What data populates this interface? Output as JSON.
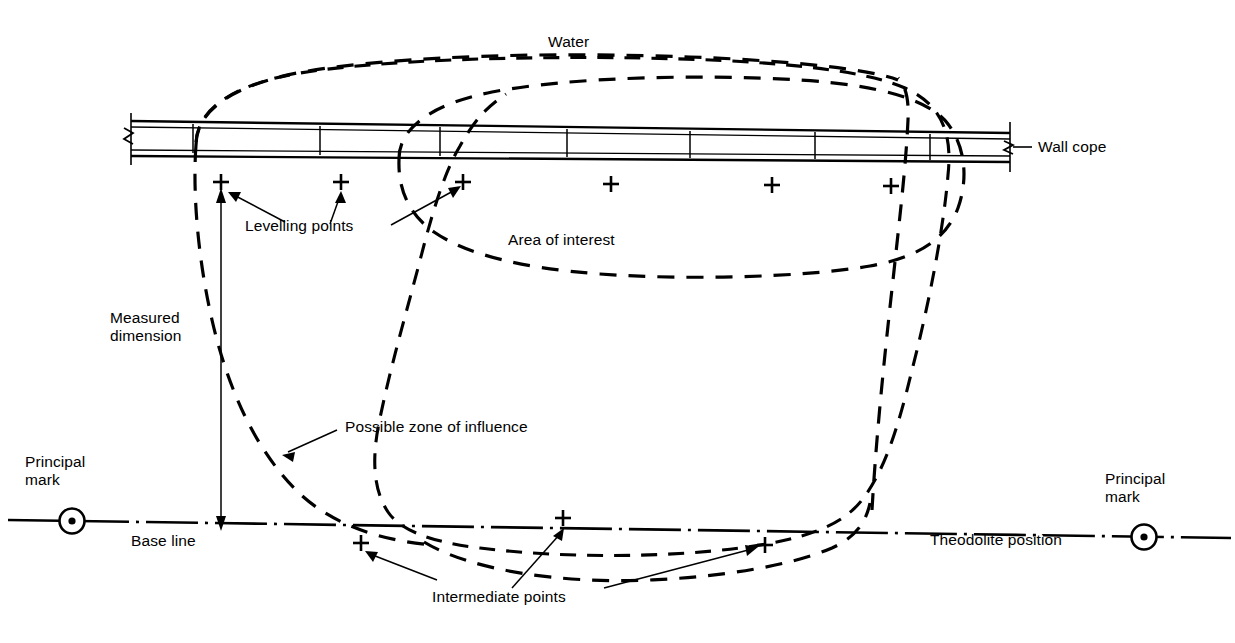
{
  "diagram": {
    "title_labels": {
      "water": "Water",
      "wall_cope": "Wall cope",
      "levelling_points": "Levelling points",
      "area_of_interest": "Area of interest",
      "measured_dimension_line1": "Measured",
      "measured_dimension_line2": "dimension",
      "possible_zone_of_influence": "Possible zone of influence",
      "principal_mark_left_line1": "Principal",
      "principal_mark_left_line2": "mark",
      "principal_mark_right_line1": "Principal",
      "principal_mark_right_line2": "mark",
      "base_line": "Base line",
      "theodolite_position": "Theodolite position",
      "intermediate_points": "Intermediate points"
    },
    "colors": {
      "ink": "#000000",
      "paper": "#ffffff"
    },
    "levelling_points": [
      {
        "x": 221,
        "y": 182
      },
      {
        "x": 341,
        "y": 182
      },
      {
        "x": 463,
        "y": 182
      },
      {
        "x": 611,
        "y": 182
      },
      {
        "x": 772,
        "y": 182
      },
      {
        "x": 891,
        "y": 182
      }
    ],
    "intermediate_points": [
      {
        "x": 361,
        "y": 543
      },
      {
        "x": 563,
        "y": 518
      },
      {
        "x": 765,
        "y": 545
      }
    ],
    "principal_marks": [
      {
        "x": 72,
        "y": 521
      },
      {
        "x": 1144,
        "y": 537
      }
    ],
    "wall_cope": {
      "left_end_x": 131,
      "right_end_x": 1010,
      "dividers": [
        193,
        320,
        440,
        567,
        690,
        815,
        930
      ]
    }
  }
}
